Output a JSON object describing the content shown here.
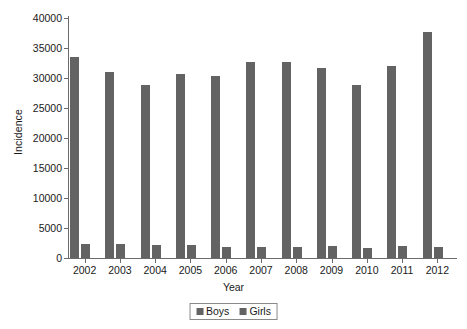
{
  "chart_data": {
    "type": "bar",
    "title": "",
    "subtitle": "",
    "xlabel": "Year",
    "ylabel": "Incidence",
    "categories": [
      "2002",
      "2003",
      "2004",
      "2005",
      "2006",
      "2007",
      "2008",
      "2009",
      "2010",
      "2011",
      "2012"
    ],
    "series": [
      {
        "name": "Boys",
        "color": "#636363",
        "values": [
          33500,
          31000,
          28900,
          30600,
          30400,
          32600,
          32700,
          31600,
          28800,
          32000,
          37700
        ]
      },
      {
        "name": "Girls",
        "color": "#636363",
        "values": [
          2300,
          2400,
          2150,
          2100,
          1800,
          1900,
          1900,
          2000,
          1700,
          2000,
          1900
        ]
      }
    ],
    "ylim": [
      0,
      40000
    ],
    "yticks": [
      "0",
      "5000",
      "10000",
      "15000",
      "20000",
      "25000",
      "30000",
      "35000",
      "40000"
    ],
    "ytick_values": [
      0,
      5000,
      10000,
      15000,
      20000,
      25000,
      30000,
      35000,
      40000
    ],
    "grid": false,
    "legend_position": "bottom",
    "legend": [
      "Boys",
      "Girls"
    ]
  },
  "legend": {
    "items": [
      {
        "label": "Boys",
        "swatch": "legend-swatch-boys"
      },
      {
        "label": "Girls",
        "swatch": "legend-swatch-girls"
      }
    ]
  }
}
